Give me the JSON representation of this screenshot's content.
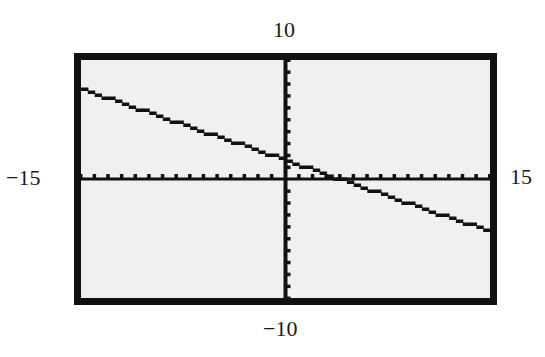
{
  "labels": {
    "ymax": "10",
    "ymin": "−10",
    "xmin": "−15",
    "xmax": "15"
  },
  "colors": {
    "screen_bg": "#f0f0f0",
    "frame": "#111111",
    "axis": "#111111",
    "line": "#111111"
  },
  "chart_data": {
    "type": "line",
    "title": "",
    "xlabel": "",
    "ylabel": "",
    "xlim": [
      -15,
      15
    ],
    "ylim": [
      -10,
      10
    ],
    "xscl": 1,
    "yscl": 1,
    "grid": false,
    "tick_labels": {
      "x": [
        "−15",
        "15"
      ],
      "y": [
        "−10",
        "10"
      ]
    },
    "series": [
      {
        "name": "y = -0.4x + 1.5",
        "x": [
          -15,
          -10,
          -5,
          0,
          3.75,
          5,
          10,
          15
        ],
        "y": [
          7.5,
          5.5,
          3.5,
          1.5,
          0,
          -0.5,
          -2.5,
          -4.5
        ]
      }
    ]
  }
}
